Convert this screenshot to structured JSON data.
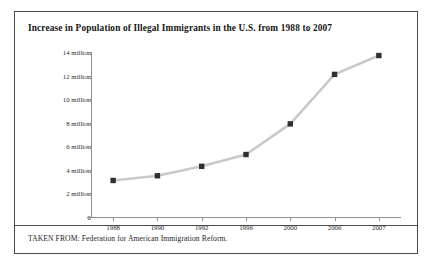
{
  "figure": {
    "title": "Increase in Population of Illegal Immigrants in the U.S. from 1988 to 2007",
    "source": "TAKEN FROM: Federation for American Immigration Reform."
  },
  "chart_data": {
    "type": "line",
    "title": "Increase in Population of Illegal Immigrants in the U.S. from 1988 to 2007",
    "xlabel": "",
    "ylabel": "",
    "categories": [
      "1988",
      "1990",
      "1992",
      "1996",
      "2000",
      "2006",
      "2007"
    ],
    "values": [
      3.1,
      3.5,
      4.3,
      5.3,
      7.9,
      12.1,
      13.7
    ],
    "value_unit": "million",
    "ylim": [
      0,
      14
    ],
    "ytick_values": [
      0,
      2,
      4,
      6,
      8,
      10,
      12,
      14
    ],
    "ytick_labels": [
      "0",
      "2 million",
      "4 million",
      "6 million",
      "8 million",
      "10 million",
      "12 million",
      "14 million"
    ],
    "grid": false,
    "legend": "none",
    "line_color": "#c9c9c9",
    "marker_color": "#2f2f2f",
    "marker_shape": "square"
  }
}
